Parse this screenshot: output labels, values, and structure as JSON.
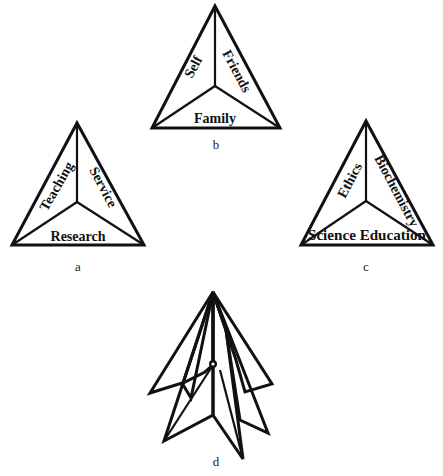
{
  "figure": {
    "panels": [
      {
        "id": "a",
        "caption": "a",
        "fill": "light-dots",
        "labels": {
          "left": "Teaching",
          "right": "Service",
          "bottom": "Research"
        }
      },
      {
        "id": "b",
        "caption": "b",
        "fill": "dense-dots",
        "labels": {
          "left": "Self",
          "right": "Friends",
          "bottom": "Family"
        }
      },
      {
        "id": "c",
        "caption": "c",
        "fill": "white",
        "labels": {
          "left": "Ethics",
          "right": "Biochemistry",
          "bottom": "Science Education"
        }
      },
      {
        "id": "d",
        "caption": "d",
        "fill": "mixed",
        "description": "three tetrahedral triangles stacked and rotated around a common axis"
      }
    ]
  },
  "colors": {
    "stroke": "#111111",
    "dense_fill_bg": "#c8c8c8",
    "light_fill_bg": "#f4f4f4",
    "white": "#ffffff"
  }
}
